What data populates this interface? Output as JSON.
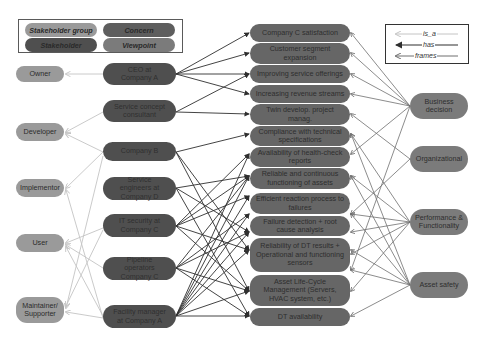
{
  "legend_node_types": {
    "stakeholder_group": "Stakeholder group",
    "concern": "Concern",
    "stakeholder": "Stakeholder",
    "viewpoint": "Viewpoint"
  },
  "legend_relations": {
    "is_a": "is_a",
    "has": "has",
    "frames": "frames"
  },
  "colors": {
    "stakeholder_group": "#9a9a9a",
    "stakeholder": "#4f4f4f",
    "concern": "#666666",
    "viewpoint": "#7b7b7b",
    "is_a_edge": "#c4c4c4",
    "has_edge": "#2f2f2f",
    "frames_edge": "#6e6e6e"
  },
  "stakeholder_groups": [
    {
      "id": "owner",
      "label": "Owner"
    },
    {
      "id": "developer",
      "label": "Developer"
    },
    {
      "id": "implementor",
      "label": "Implementor"
    },
    {
      "id": "user",
      "label": "User"
    },
    {
      "id": "maintainer",
      "label": "Maintainer/ Supporter"
    }
  ],
  "stakeholders": [
    {
      "id": "ceo",
      "label": "CEO at Company A"
    },
    {
      "id": "consultant",
      "label": "Service concept consultant"
    },
    {
      "id": "companyb",
      "label": "Company B"
    },
    {
      "id": "engineers",
      "label": "Service engineers at Company D"
    },
    {
      "id": "itsec",
      "label": "IT security at Company C"
    },
    {
      "id": "pipeline",
      "label": "Pipeline operators Company C"
    },
    {
      "id": "facility",
      "label": "Facility manager at Company A"
    }
  ],
  "concerns": [
    {
      "id": "c1",
      "label": "Company C satisfaction"
    },
    {
      "id": "c2",
      "label": "Customer segment expansion"
    },
    {
      "id": "c3",
      "label": "Improving service offerings"
    },
    {
      "id": "c4",
      "label": "Increasing revenue streams"
    },
    {
      "id": "c5",
      "label": "Twin develop. project manag."
    },
    {
      "id": "c6",
      "label": "Compliance with technical specifications"
    },
    {
      "id": "c7",
      "label": "Availability of health-check reports"
    },
    {
      "id": "c8",
      "label": "Reliable and continuous functioning of assets"
    },
    {
      "id": "c9",
      "label": "Efficient reaction process to failures"
    },
    {
      "id": "c10",
      "label": "Failure detection + root cause analysis"
    },
    {
      "id": "c11",
      "label": "Reliability of DT results + Operational and functioning sensors"
    },
    {
      "id": "c12",
      "label": "Asset Life-Cycle Management (Servers, HVAC system, etc.)"
    },
    {
      "id": "c13",
      "label": "DT availability"
    }
  ],
  "viewpoints": [
    {
      "id": "business",
      "label": "Business decision"
    },
    {
      "id": "organizational",
      "label": "Organizational"
    },
    {
      "id": "performance",
      "label": "Performance & Functionality"
    },
    {
      "id": "safety",
      "label": "Asset safety"
    }
  ]
}
